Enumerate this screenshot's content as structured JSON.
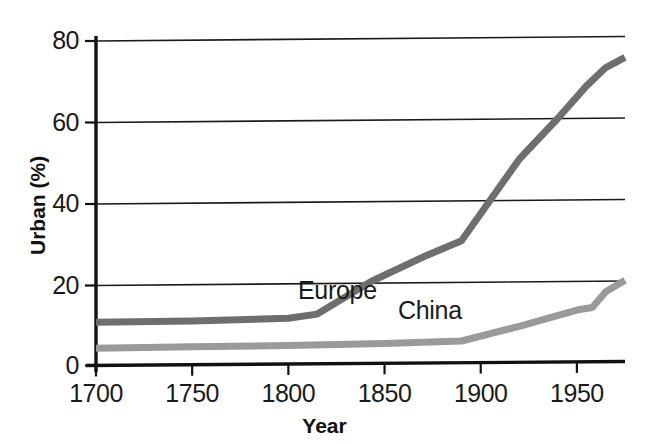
{
  "chart_data": {
    "type": "line",
    "title": "",
    "xlabel": "Year",
    "ylabel": "Urban (%)",
    "xlim": [
      1700,
      1975
    ],
    "ylim": [
      0,
      82
    ],
    "xticks": [
      1700,
      1750,
      1800,
      1850,
      1900,
      1950
    ],
    "yticks": [
      0,
      20,
      40,
      60,
      80
    ],
    "xticklabels": [
      "1700",
      "1750",
      "1800",
      "1850",
      "1900",
      "1950"
    ],
    "yticklabels": [
      "0",
      "20",
      "40",
      "60",
      "80"
    ],
    "grid": "horizontal",
    "legend": "inline-labels",
    "series": [
      {
        "name": "Europe",
        "color": "#6e6e6e",
        "label_x": 1805,
        "label_y": 17.5,
        "x": [
          1700,
          1750,
          1800,
          1815,
          1843,
          1870,
          1890,
          1905,
          1920,
          1940,
          1955,
          1965,
          1975
        ],
        "values": [
          10.0,
          10.3,
          11.0,
          12.0,
          20.0,
          26.0,
          30.0,
          40.0,
          50.0,
          60.0,
          68.0,
          72.5,
          75.0
        ]
      },
      {
        "name": "China",
        "color": "#9a9a9a",
        "label_x": 1857,
        "label_y": 12.5,
        "x": [
          1700,
          1750,
          1800,
          1850,
          1890,
          1920,
          1950,
          1958,
          1965,
          1975
        ],
        "values": [
          3.6,
          4.0,
          4.3,
          4.8,
          5.4,
          9.0,
          13.0,
          13.6,
          17.5,
          20.3
        ]
      }
    ]
  },
  "axes": {
    "y_title": "Urban (%)",
    "x_title": "Year"
  }
}
